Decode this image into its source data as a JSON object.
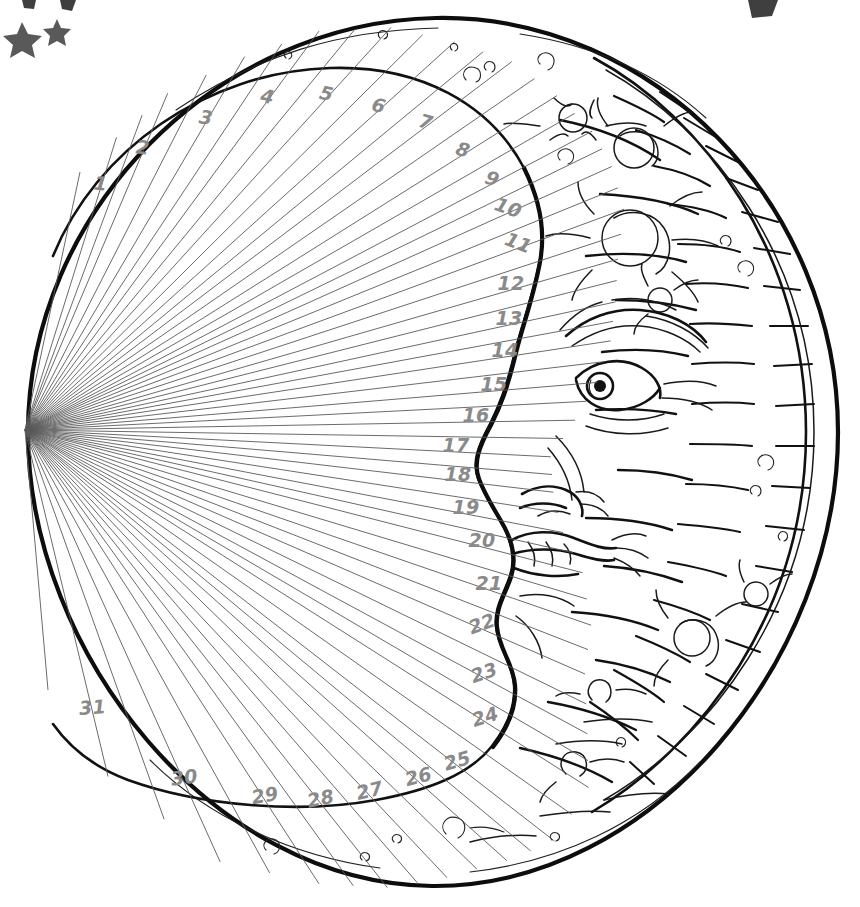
{
  "artwork": {
    "title": "Crescent Moon Face Calendar Wheel",
    "style": "hand-drawn black ink line art on white",
    "background_color": "#ffffff",
    "ink_color": "#111111",
    "ray_color": "#5a5a5a",
    "number_color": "#8a8a8a",
    "star_color": "#595959"
  },
  "calendar": {
    "description": "Fan of 31 numbered radial segments filling the dark/empty side of the crescent",
    "count": 31,
    "days": [
      {
        "n": "1",
        "x": 100,
        "y": 190
      },
      {
        "n": "2",
        "x": 142,
        "y": 154
      },
      {
        "n": "3",
        "x": 205,
        "y": 124
      },
      {
        "n": "4",
        "x": 266,
        "y": 103
      },
      {
        "n": "5",
        "x": 325,
        "y": 100
      },
      {
        "n": "6",
        "x": 377,
        "y": 112
      },
      {
        "n": "7",
        "x": 424,
        "y": 128
      },
      {
        "n": "8",
        "x": 461,
        "y": 156
      },
      {
        "n": "9",
        "x": 490,
        "y": 185
      },
      {
        "n": "10",
        "x": 506,
        "y": 214
      },
      {
        "n": "11",
        "x": 516,
        "y": 249
      },
      {
        "n": "12",
        "x": 511,
        "y": 290
      },
      {
        "n": "13",
        "x": 509,
        "y": 325
      },
      {
        "n": "14",
        "x": 505,
        "y": 357
      },
      {
        "n": "15",
        "x": 494,
        "y": 391
      },
      {
        "n": "16",
        "x": 476,
        "y": 422
      },
      {
        "n": "17",
        "x": 456,
        "y": 452
      },
      {
        "n": "18",
        "x": 458,
        "y": 481
      },
      {
        "n": "19",
        "x": 466,
        "y": 514
      },
      {
        "n": "20",
        "x": 482,
        "y": 547
      },
      {
        "n": "21",
        "x": 489,
        "y": 590
      },
      {
        "n": "22",
        "x": 484,
        "y": 630
      },
      {
        "n": "23",
        "x": 486,
        "y": 679
      },
      {
        "n": "24",
        "x": 487,
        "y": 723
      },
      {
        "n": "25",
        "x": 459,
        "y": 767
      },
      {
        "n": "26",
        "x": 420,
        "y": 783
      },
      {
        "n": "27",
        "x": 371,
        "y": 797
      },
      {
        "n": "28",
        "x": 322,
        "y": 805
      },
      {
        "n": "29",
        "x": 266,
        "y": 802
      },
      {
        "n": "30",
        "x": 185,
        "y": 784
      },
      {
        "n": "31",
        "x": 93,
        "y": 714
      }
    ]
  },
  "moon": {
    "face_description": "Man-in-the-moon profile facing left with brow, eye, nose, lips and chin",
    "features": [
      "brow",
      "eye",
      "nose",
      "lips",
      "chin",
      "cheek"
    ],
    "crater_count_label": "multiple craters and speckles on the lit crescent",
    "rim_label": "hatched crescent rim with cross-tick shading"
  },
  "decorations": {
    "stars": [
      {
        "name": "star-large",
        "x": 22,
        "y": 37,
        "r": 14
      },
      {
        "name": "star-small",
        "x": 57,
        "y": 28,
        "r": 9
      }
    ],
    "clipped_marks": [
      {
        "name": "clipped-mark-top-left-a",
        "x": 28,
        "y": 2
      },
      {
        "name": "clipped-mark-top-left-b",
        "x": 66,
        "y": 1
      },
      {
        "name": "clipped-mark-top-right",
        "x": 757,
        "y": 4
      }
    ]
  }
}
